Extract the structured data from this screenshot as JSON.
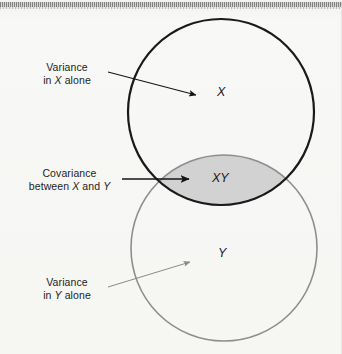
{
  "figure": {
    "type": "venn-diagram",
    "background_color": "#f7f7f5",
    "circles": [
      {
        "id": "x",
        "label": "X",
        "label_text": "X",
        "stroke_color": "#1a1a1a",
        "stroke_width": 2.2,
        "fill": "none",
        "cx": 221,
        "cy": 112,
        "r": 93
      },
      {
        "id": "y",
        "label": "Y",
        "label_text": "Y",
        "stroke_color": "#8e8e8e",
        "stroke_width": 1.6,
        "fill": "none",
        "cx": 224,
        "cy": 248,
        "r": 93
      }
    ],
    "overlap": {
      "id": "xy",
      "label_text": "XY",
      "fill_color": "#d2d2d2",
      "description": "intersection of X and Y"
    }
  },
  "annotations": [
    {
      "id": "variance-x",
      "line1": "Variance",
      "line2_prefix": "in ",
      "line2_italic": "X",
      "line2_suffix": " alone",
      "full_text": "Variance in X alone",
      "arrow_color": "#1a1a1a",
      "points_to": "X circle (X alone region)"
    },
    {
      "id": "covariance-xy",
      "line1": "Covariance",
      "line2_prefix": "between ",
      "line2_italic": "X",
      "line2_mid": " and ",
      "line2_italic2": "Y",
      "full_text": "Covariance between X and Y",
      "arrow_color": "#1a1a1a",
      "points_to": "XY overlap region"
    },
    {
      "id": "variance-y",
      "line1": "Variance",
      "line2_prefix": "in ",
      "line2_italic": "Y",
      "line2_suffix": " alone",
      "full_text": "Variance in Y alone",
      "arrow_color": "#8a8a8a",
      "points_to": "Y circle (Y alone region)"
    }
  ],
  "labels": {
    "x_set": "X",
    "xy_set": "XY",
    "y_set": "Y"
  }
}
